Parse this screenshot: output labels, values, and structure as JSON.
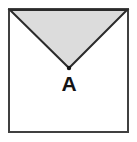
{
  "figure": {
    "type": "geometry-diagram",
    "background_color": "#ffffff",
    "square": {
      "name": "outer-square",
      "x": 9,
      "y": 9,
      "width": 119,
      "height": 123,
      "stroke_color": "#404040",
      "stroke_width": 2,
      "fill_color": "#ffffff"
    },
    "triangle": {
      "name": "shaded-inverted-triangle",
      "points": "10,10 127,10 69,68",
      "fill_color": "#dcdcdc",
      "stroke_color": "#2b2b2b",
      "stroke_width": 2
    },
    "apex_point": {
      "name": "apex-vertex-dot",
      "cx": 69,
      "cy": 68,
      "r": 2,
      "color": "#141414"
    },
    "labels": [
      {
        "name": "vertex-label-a",
        "text": "A",
        "x": 69,
        "y": 91,
        "color": "#141414",
        "font_size": 21
      }
    ]
  }
}
